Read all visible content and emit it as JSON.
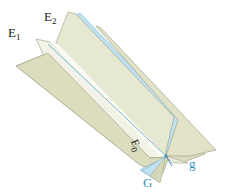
{
  "diagram": {
    "type": "pencil-of-planes",
    "planes": [
      {
        "id": "E0",
        "label_main": "E",
        "label_sub": "0",
        "color": "#dcdcbf"
      },
      {
        "id": "E1",
        "label_main": "E",
        "label_sub": "1",
        "color": "#e6e6cf"
      },
      {
        "id": "E2",
        "label_main": "E",
        "label_sub": "2",
        "color": "#ecebd6"
      },
      {
        "id": "G",
        "label_main": "G",
        "label_sub": "",
        "color": "#bfe3f2"
      }
    ],
    "line": {
      "id": "g",
      "label": "g",
      "color": "#3a8fc0"
    },
    "colors": {
      "plane_fill": "#dedec4",
      "plane_light": "#eceedd",
      "plane_highlight": "#f6f7ee",
      "blue_plane": "#bfe2f3",
      "edge": "#8a8a72",
      "label_dark": "#1a1a1a",
      "label_blue": "#3a8fc0"
    }
  }
}
